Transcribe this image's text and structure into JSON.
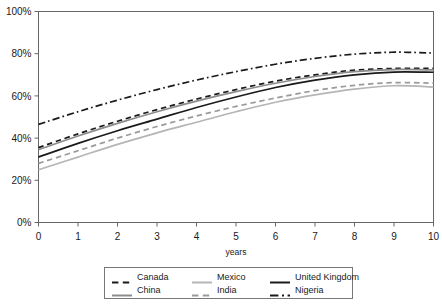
{
  "chart_data": {
    "type": "line",
    "title": "",
    "xlabel": "years",
    "ylabel": "",
    "x": [
      0,
      1,
      2,
      3,
      4,
      5,
      6,
      7,
      8,
      9,
      10
    ],
    "xlim": [
      0,
      10
    ],
    "ylim": [
      0,
      100
    ],
    "y_tick_labels": [
      "0%",
      "20%",
      "40%",
      "60%",
      "80%",
      "100%"
    ],
    "y_ticks": [
      0,
      20,
      40,
      60,
      80,
      100
    ],
    "x_tick_labels": [
      "0",
      "1",
      "2",
      "3",
      "4",
      "5",
      "6",
      "7",
      "8",
      "9",
      "10"
    ],
    "grid": false,
    "legend_position": "bottom",
    "value_unit": "%",
    "series": [
      {
        "name": "Canada",
        "style": "dashed",
        "color": "#1a1a1a",
        "values": [
          35.5,
          42.0,
          48.0,
          53.5,
          58.5,
          63.0,
          67.0,
          70.0,
          72.2,
          73.0,
          73.0
        ]
      },
      {
        "name": "China",
        "style": "solid",
        "color": "#8c8c8c",
        "values": [
          34.5,
          41.0,
          47.0,
          52.5,
          57.5,
          62.0,
          66.0,
          69.2,
          71.5,
          72.5,
          72.3
        ]
      },
      {
        "name": "Mexico",
        "style": "solid",
        "color": "#b5b5b5",
        "values": [
          25.0,
          31.0,
          37.0,
          42.5,
          47.5,
          52.5,
          57.0,
          60.5,
          63.2,
          64.8,
          64.2
        ]
      },
      {
        "name": "India",
        "style": "dashed",
        "color": "#9a9a9a",
        "values": [
          28.0,
          34.0,
          40.0,
          45.5,
          50.5,
          55.0,
          59.0,
          62.5,
          65.0,
          66.3,
          66.0
        ]
      },
      {
        "name": "United Kingdom",
        "style": "solid",
        "color": "#1a1a1a",
        "values": [
          31.0,
          37.5,
          43.5,
          49.0,
          54.5,
          59.5,
          64.0,
          67.5,
          70.0,
          71.3,
          71.2
        ]
      },
      {
        "name": "Nigeria",
        "style": "dashdot",
        "color": "#1a1a1a",
        "values": [
          46.5,
          52.5,
          58.0,
          63.0,
          67.5,
          71.5,
          75.0,
          77.8,
          79.8,
          80.7,
          80.3
        ]
      }
    ]
  },
  "legend": {
    "items": [
      {
        "label": "Canada"
      },
      {
        "label": "Mexico"
      },
      {
        "label": "United Kingdom"
      },
      {
        "label": "China"
      },
      {
        "label": "India"
      },
      {
        "label": "Nigeria"
      }
    ]
  }
}
